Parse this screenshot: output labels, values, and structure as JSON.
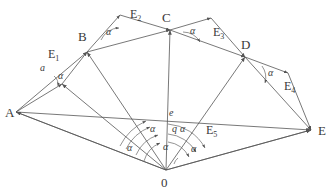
{
  "figure": {
    "background": "#ffffff",
    "stroke_color": "#555555",
    "label_color": "#3a3a3a"
  },
  "vertices": [
    {
      "id": "A",
      "label": "A",
      "x": 16,
      "y": 112,
      "label_x": 5,
      "label_y": 106
    },
    {
      "id": "B",
      "label": "B",
      "x": 87,
      "y": 52,
      "label_x": 78,
      "label_y": 30
    },
    {
      "id": "C",
      "label": "C",
      "x": 170,
      "y": 30,
      "label_x": 162,
      "label_y": 11
    },
    {
      "id": "D",
      "label": "D",
      "x": 245,
      "y": 57,
      "label_x": 241,
      "label_y": 38
    },
    {
      "id": "E",
      "label": "E",
      "x": 311,
      "y": 130,
      "label_x": 318,
      "label_y": 124
    },
    {
      "id": "O",
      "label": "0",
      "x": 166,
      "y": 170,
      "label_x": 161,
      "label_y": 176
    }
  ],
  "apex_points": [
    {
      "id": "T1",
      "x": 62,
      "y": 84,
      "note": "apex of triangle A-B"
    },
    {
      "id": "T2",
      "x": 120,
      "y": 15,
      "note": "apex of triangle B-C"
    },
    {
      "id": "T3",
      "x": 211,
      "y": 18,
      "note": "apex of triangle C-D"
    },
    {
      "id": "T4",
      "x": 288,
      "y": 73,
      "note": "apex of triangle D-E"
    },
    {
      "id": "T5",
      "x": 170,
      "y": 117,
      "note": "point e on chord AE"
    }
  ],
  "edge_labels": [
    {
      "text": "E",
      "sub": "1",
      "x": 48,
      "y": 48
    },
    {
      "text": "E",
      "sub": "2",
      "x": 130,
      "y": 8
    },
    {
      "text": "E",
      "sub": "3",
      "x": 213,
      "y": 26
    },
    {
      "text": "E",
      "sub": "4",
      "x": 284,
      "y": 80
    },
    {
      "text": "E",
      "sub": "5",
      "x": 206,
      "y": 124
    }
  ],
  "angle_labels": [
    {
      "text": "α",
      "x": 58,
      "y": 71,
      "where": "at-a-intersection"
    },
    {
      "text": "α",
      "x": 106,
      "y": 27,
      "where": "at-B-upper"
    },
    {
      "text": "α",
      "x": 190,
      "y": 26,
      "where": "at-C-upper"
    },
    {
      "text": "α",
      "x": 268,
      "y": 68,
      "where": "at-D-lower"
    },
    {
      "text": "α",
      "x": 150,
      "y": 124,
      "where": "centre-left"
    },
    {
      "text": "α",
      "x": 180,
      "y": 124,
      "where": "centre-right"
    },
    {
      "text": "α",
      "x": 127,
      "y": 143,
      "where": "fan-far-left"
    },
    {
      "text": "α",
      "x": 163,
      "y": 142,
      "where": "fan-mid"
    },
    {
      "text": "α",
      "x": 191,
      "y": 144,
      "where": "fan-right"
    }
  ],
  "scalar_labels": [
    {
      "text": "a",
      "x": 40,
      "y": 63,
      "where": "segment-A-T1"
    },
    {
      "text": "e",
      "x": 169,
      "y": 108,
      "where": "point-on-chord-AE"
    },
    {
      "text": "q",
      "x": 172,
      "y": 124,
      "where": "centre-q"
    }
  ],
  "segments": [
    {
      "from": "A",
      "to": "B",
      "kind": "outer"
    },
    {
      "from": "A",
      "to": "T1",
      "kind": "outer"
    },
    {
      "from": "T1",
      "to": "B",
      "kind": "outer"
    },
    {
      "from": "B",
      "to": "C",
      "kind": "outer"
    },
    {
      "from": "B",
      "to": "T2",
      "kind": "outer"
    },
    {
      "from": "T2",
      "to": "C",
      "kind": "outer"
    },
    {
      "from": "C",
      "to": "D",
      "kind": "outer"
    },
    {
      "from": "C",
      "to": "T3",
      "kind": "outer"
    },
    {
      "from": "T3",
      "to": "D",
      "kind": "outer"
    },
    {
      "from": "D",
      "to": "E",
      "kind": "outer"
    },
    {
      "from": "D",
      "to": "T4",
      "kind": "outer"
    },
    {
      "from": "T4",
      "to": "E",
      "kind": "outer"
    },
    {
      "from": "A",
      "to": "E",
      "kind": "chord"
    },
    {
      "from": "O",
      "to": "A",
      "kind": "radius"
    },
    {
      "from": "O",
      "to": "B",
      "kind": "radius"
    },
    {
      "from": "O",
      "to": "C",
      "kind": "radius"
    },
    {
      "from": "O",
      "to": "D",
      "kind": "radius"
    },
    {
      "from": "O",
      "to": "E",
      "kind": "radius"
    },
    {
      "from": "O",
      "to": "T1",
      "kind": "radius"
    },
    {
      "from": "A",
      "to": "O",
      "kind": "base"
    },
    {
      "from": "O",
      "to": "E",
      "kind": "base"
    }
  ]
}
